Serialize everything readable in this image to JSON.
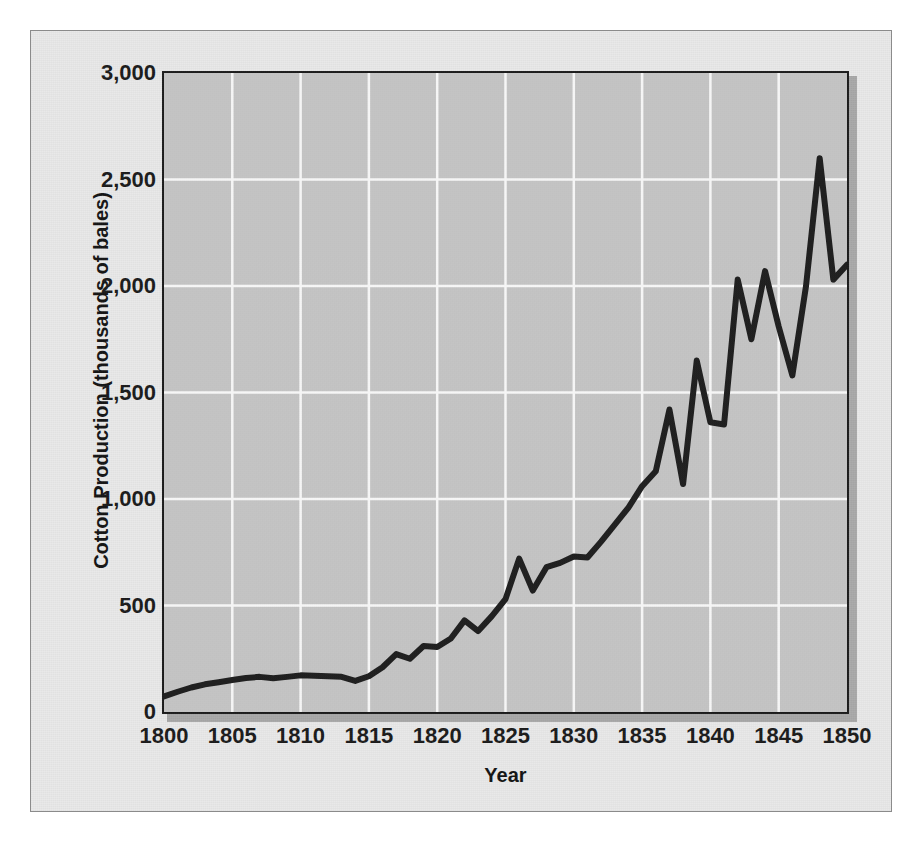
{
  "figure": {
    "background_color": "#e9e9e9",
    "plot_background_color": "#c9c9c9",
    "gridline_color": "#ffffff",
    "line_color": "#1a1a1a",
    "border_color": "#1c1c1c"
  },
  "chart_data": {
    "type": "line",
    "title": "",
    "subtitle": "",
    "xlabel": "Year",
    "ylabel": "Cotton Production (thousands of bales)",
    "xlim": [
      1800,
      1850
    ],
    "ylim": [
      0,
      3000
    ],
    "xticks": [
      1800,
      1805,
      1810,
      1815,
      1820,
      1825,
      1830,
      1835,
      1840,
      1845,
      1850
    ],
    "xticklabels": [
      "1800",
      "1805",
      "1810",
      "1815",
      "1820",
      "1825",
      "1830",
      "1835",
      "1840",
      "1845",
      "1850"
    ],
    "yticks": [
      0,
      500,
      1000,
      1500,
      2000,
      2500,
      3000
    ],
    "yticklabels": [
      "0",
      "500",
      "1,000",
      "1,500",
      "2,000",
      "2,500",
      "3,000"
    ],
    "grid": true,
    "grid_axes": "both",
    "legend": false,
    "legend_position": "none",
    "annotations": [],
    "series": [
      {
        "name": "Cotton Production",
        "color": "#1a1a1a",
        "line_width": 6,
        "x": [
          1800,
          1801,
          1802,
          1803,
          1804,
          1805,
          1806,
          1807,
          1808,
          1809,
          1810,
          1811,
          1812,
          1813,
          1814,
          1815,
          1816,
          1817,
          1818,
          1819,
          1820,
          1821,
          1822,
          1823,
          1824,
          1825,
          1826,
          1827,
          1828,
          1829,
          1830,
          1831,
          1832,
          1833,
          1834,
          1835,
          1836,
          1837,
          1838,
          1839,
          1840,
          1841,
          1842,
          1843,
          1844,
          1845,
          1846,
          1847,
          1848,
          1849,
          1850
        ],
        "values": [
          73,
          95,
          115,
          130,
          140,
          150,
          160,
          165,
          158,
          165,
          172,
          170,
          168,
          165,
          146,
          168,
          210,
          272,
          250,
          310,
          305,
          345,
          430,
          380,
          450,
          530,
          720,
          570,
          680,
          700,
          730,
          725,
          800,
          880,
          960,
          1060,
          1130,
          1420,
          1070,
          1650,
          1360,
          1350,
          2030,
          1750,
          2070,
          1810,
          1580,
          2000,
          2600,
          2030,
          2100
        ]
      }
    ]
  }
}
